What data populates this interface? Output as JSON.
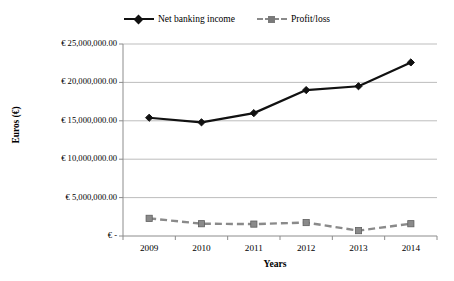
{
  "chart_data": {
    "type": "line",
    "title": "",
    "xlabel": "Years",
    "ylabel": "Euros (€)",
    "categories": [
      "2009",
      "2010",
      "2011",
      "2012",
      "2013",
      "2014"
    ],
    "ylim": [
      0,
      25000000
    ],
    "ytick_values": [
      0,
      5000000,
      10000000,
      15000000,
      20000000,
      25000000
    ],
    "ytick_labels": [
      "€ -",
      "€ 5,000,000.00",
      "€ 10,000,000.00",
      "€ 15,000,000.00",
      "€ 20,000,000.00",
      "€ 25,000,000.00"
    ],
    "grid": "horizontal",
    "legend_position": "top-center",
    "series": [
      {
        "name": "Net banking income",
        "color": "#111111",
        "marker": "diamond",
        "line_style": "solid",
        "values": [
          15400000,
          14800000,
          16000000,
          19000000,
          19500000,
          22600000
        ]
      },
      {
        "name": "Profit/loss",
        "color": "#8a8a8a",
        "marker": "square",
        "line_style": "dashed",
        "values": [
          2300000,
          1600000,
          1550000,
          1750000,
          700000,
          1600000
        ]
      }
    ]
  },
  "legend": {
    "entries": [
      {
        "label": "Net banking income"
      },
      {
        "label": "Profit/loss"
      }
    ]
  },
  "axes": {
    "x_title": "Years",
    "y_title": "Euros (€)"
  }
}
